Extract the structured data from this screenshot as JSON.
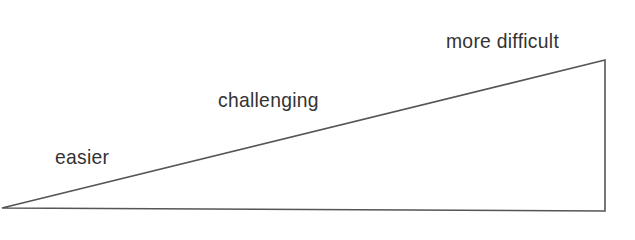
{
  "diagram": {
    "type": "difficulty-wedge",
    "stroke_color": "#555555",
    "text_color": "#333333",
    "background": "#ffffff",
    "vertices": {
      "apex": [
        2,
        208
      ],
      "top_right": [
        605,
        60
      ],
      "bottom_right": [
        605,
        211
      ]
    },
    "labels": [
      {
        "text": "easier"
      },
      {
        "text": "challenging"
      },
      {
        "text": "more difficult"
      }
    ]
  }
}
